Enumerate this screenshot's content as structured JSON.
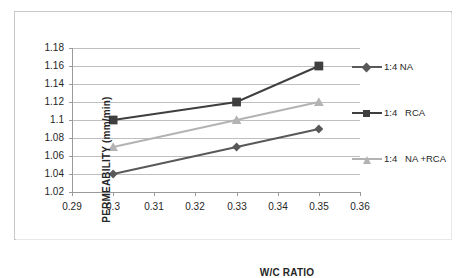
{
  "chart_data": {
    "type": "line",
    "title": "",
    "xlabel": "W/C RATIO",
    "ylabel": "PERMEABILITY   (mm/min)",
    "x": [
      0.3,
      0.33,
      0.35
    ],
    "xlim": [
      0.29,
      0.36
    ],
    "ylim": [
      1.02,
      1.18
    ],
    "xticks": [
      "0.29",
      "0.3",
      "0.31",
      "0.32",
      "0.33",
      "0.34",
      "0.35",
      "0.36"
    ],
    "xtick_values": [
      0.29,
      0.3,
      0.31,
      0.32,
      0.33,
      0.34,
      0.35,
      0.36
    ],
    "yticks": [
      "1.02",
      "1.04",
      "1.06",
      "1.08",
      "1.1",
      "1.12",
      "1.14",
      "1.16",
      "1.18"
    ],
    "ytick_values": [
      1.02,
      1.04,
      1.06,
      1.08,
      1.1,
      1.12,
      1.14,
      1.16,
      1.18
    ],
    "grid": "horizontal",
    "legend_position": "right",
    "series": [
      {
        "name": "1:4 NA",
        "marker": "diamond",
        "color": "#595959",
        "values": [
          1.04,
          1.07,
          1.09
        ]
      },
      {
        "name": "1:4   RCA",
        "marker": "square",
        "color": "#3f3f3f",
        "values": [
          1.1,
          1.12,
          1.16
        ]
      },
      {
        "name": "1:4   NA +RCA",
        "marker": "triangle",
        "color": "#b3b3b3",
        "values": [
          1.07,
          1.1,
          1.12
        ]
      }
    ]
  },
  "axes": {
    "y_title": "PERMEABILITY   (mm/min)",
    "x_title": "W/C RATIO",
    "y_tick_labels": [
      "1.18",
      "1.16",
      "1.14",
      "1.12",
      "1.1",
      "1.08",
      "1.06",
      "1.04",
      "1.02"
    ],
    "x_tick_labels": [
      "0.29",
      "0.3",
      "0.31",
      "0.32",
      "0.33",
      "0.34",
      "0.35",
      "0.36"
    ]
  },
  "legend": {
    "items": [
      {
        "label": "1:4 NA",
        "color": "#595959",
        "marker": "diamond-icon"
      },
      {
        "label": "1:4   RCA",
        "color": "#3f3f3f",
        "marker": "square-icon"
      },
      {
        "label": "1:4   NA +RCA",
        "color": "#b3b3b3",
        "marker": "triangle-icon"
      }
    ]
  },
  "colors": {
    "series_na": "#595959",
    "series_rca": "#3f3f3f",
    "series_na_rca": "#b3b3b3",
    "gridline": "#bfbfbf",
    "axis": "#9a9a9a",
    "border": "#c8c8c8",
    "background": "#ffffff",
    "text": "#262626"
  }
}
